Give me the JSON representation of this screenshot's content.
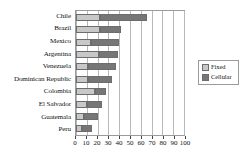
{
  "chart_data": {
    "type": "bar",
    "orientation": "horizontal",
    "stacked": true,
    "title": "",
    "xlabel": "",
    "ylabel": "",
    "xlim": [
      0,
      100
    ],
    "xticks": [
      0,
      10,
      20,
      30,
      40,
      50,
      60,
      70,
      80,
      90,
      100
    ],
    "xtick_labels": [
      "0",
      "10",
      "20",
      "30",
      "40",
      "50",
      "60",
      "70",
      "80",
      "90",
      "100"
    ],
    "grid": "vertical",
    "legend_position": "right",
    "categories": [
      "Chile",
      "Brazil",
      "Mexico",
      "Argentina",
      "Venezuela",
      "Dominican Republic",
      "Colombia",
      "El Salvador",
      "Guatemala",
      "Peru"
    ],
    "series": [
      {
        "name": "Fixed",
        "color": "#c8c8c8",
        "values": [
          22,
          22,
          14,
          21,
          11,
          11,
          18,
          10,
          7,
          6
        ]
      },
      {
        "name": "Cellular",
        "color": "#767676",
        "values": [
          44,
          20,
          26,
          18,
          26,
          22,
          10,
          14,
          13,
          9
        ]
      }
    ],
    "totals": [
      66,
      42,
      40,
      39,
      37,
      33,
      28,
      24,
      20,
      15
    ]
  },
  "legend": {
    "items": [
      {
        "label": "Fixed",
        "color": "#c8c8c8"
      },
      {
        "label": "Cellular",
        "color": "#767676"
      }
    ]
  }
}
